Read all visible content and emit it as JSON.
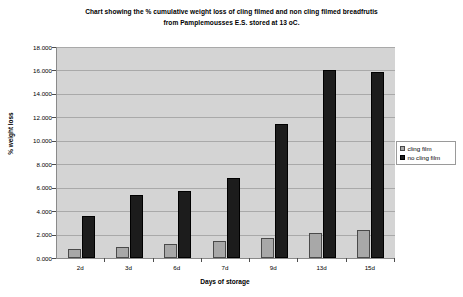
{
  "chart_data": {
    "type": "bar",
    "title": "Chart showing the % cumulative weight loss of cling filmed and non cling filmed breadfrutis from Pamplemousses E.S. stored at 13 oC.",
    "title_lines": [
      "Chart showing the % cumulative weight loss of cling filmed and non cling filmed breadfrutis",
      "from Pamplemousses E.S. stored at 13 oC."
    ],
    "xlabel": "Days of storage",
    "ylabel": "% weight loss",
    "categories": [
      "2d",
      "3d",
      "6d",
      "7d",
      "9d",
      "13d",
      "15d"
    ],
    "series": [
      {
        "name": "cling film",
        "color": "#a8a8a8",
        "values": [
          0.8,
          0.95,
          1.2,
          1.45,
          1.75,
          2.1,
          2.35
        ]
      },
      {
        "name": "no cling film",
        "color": "#1c1c1c",
        "values": [
          3.6,
          5.4,
          5.75,
          6.85,
          11.4,
          16.0,
          15.85
        ]
      }
    ],
    "ylim": [
      0,
      18
    ],
    "ytick_step": 2,
    "ytick_labels": [
      "0.000",
      "2.000",
      "4.000",
      "6.000",
      "8.000",
      "10.000",
      "12.000",
      "14.000",
      "16.000",
      "18.000"
    ],
    "grid": true,
    "legend_position": "right",
    "plot_background": "#d4d4d4"
  },
  "legend": {
    "items": [
      {
        "label": "cling film"
      },
      {
        "label": "no cling film"
      }
    ]
  }
}
